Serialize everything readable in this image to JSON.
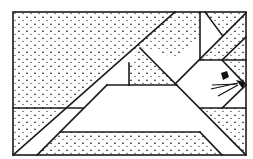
{
  "diagram": {
    "colors": {
      "stroke": "#1a1a1a",
      "fill_plain": "#ffffff",
      "fill_dotted_mark": "#222222"
    },
    "frame": {
      "x": 13,
      "y": 12,
      "w": 233,
      "h": 143
    },
    "regions": [
      {
        "name": "top-left-dotted",
        "pattern": "dotted"
      },
      {
        "name": "left-band-plain",
        "pattern": "plain"
      },
      {
        "name": "bottom-left-dotted",
        "pattern": "dotted"
      },
      {
        "name": "center-triangle-plain",
        "pattern": "plain"
      },
      {
        "name": "small-triangle-plain",
        "pattern": "plain"
      },
      {
        "name": "small-trapezoid-dotted",
        "pattern": "dotted"
      },
      {
        "name": "upper-band-dotted",
        "pattern": "dotted"
      },
      {
        "name": "bottom-dotted",
        "pattern": "dotted"
      },
      {
        "name": "right-band-plain",
        "pattern": "plain"
      },
      {
        "name": "head-plain",
        "pattern": "plain"
      },
      {
        "name": "right-lower-dotted",
        "pattern": "dotted"
      },
      {
        "name": "top-right-dotted",
        "pattern": "dotted"
      }
    ]
  }
}
